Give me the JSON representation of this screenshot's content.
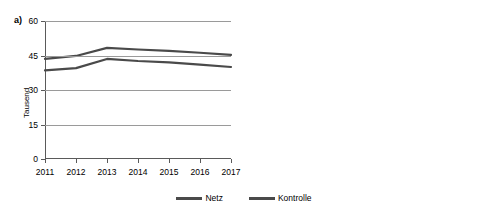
{
  "figure": {
    "panel_a_tag": "a)",
    "panel_b_tag": "b)"
  },
  "legend": {
    "items": [
      {
        "label": "Netz",
        "color": "#4a4a4a"
      },
      {
        "label": "Kontrolle",
        "color": "#4a4a4a"
      }
    ]
  },
  "chart_data": [
    {
      "type": "line",
      "panel": "a)",
      "title": "",
      "xlabel": "",
      "ylabel": "Tausend",
      "categories": [
        "2011",
        "2012",
        "2013",
        "2014",
        "2015",
        "2016",
        "2017"
      ],
      "yticks": [
        "0",
        "15",
        "30",
        "45",
        "60"
      ],
      "ytick_values": [
        0,
        15,
        30,
        45,
        60
      ],
      "ylim": [
        0,
        60
      ],
      "grid": true,
      "legend_position": "bottom-center",
      "series": [
        {
          "name": "Netz",
          "color": "#4a4a4a",
          "values": [
            43.5,
            44.8,
            48.3,
            47.6,
            47.0,
            46.2,
            45.3
          ]
        },
        {
          "name": "Kontrolle",
          "color": "#4a4a4a",
          "values": [
            38.5,
            39.5,
            43.5,
            42.6,
            42.0,
            41.0,
            40.0
          ]
        }
      ]
    },
    {
      "type": "line",
      "panel": "b)",
      "title": "",
      "xlabel": "",
      "ylabel": "",
      "categories": [
        "2011",
        "2012",
        "2013",
        "2014",
        "2015",
        "2016",
        "2017"
      ],
      "yticks": [
        "18%",
        "20%",
        "22%",
        "24%",
        "26%"
      ],
      "ytick_values": [
        18,
        20,
        22,
        24,
        26
      ],
      "ylim": [
        18,
        26
      ],
      "grid": true,
      "legend_position": "bottom-center",
      "series": [
        {
          "name": "Netz",
          "color": "#4a4a4a",
          "values": [
            20.5,
            21.3,
            22.8,
            24.05,
            24.6,
            25.15,
            25.05
          ]
        },
        {
          "name": "Kontrolle",
          "color": "#4a4a4a",
          "values": [
            19.4,
            20.1,
            21.8,
            22.9,
            23.85,
            24.35,
            24.2
          ]
        }
      ]
    }
  ]
}
